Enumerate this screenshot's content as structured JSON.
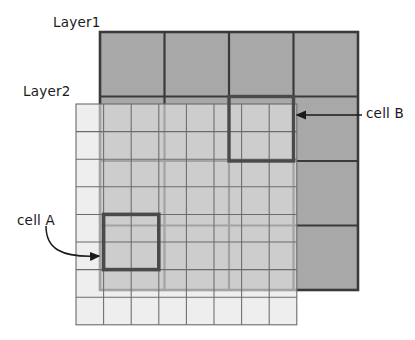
{
  "figure": {
    "title": "",
    "labels": {
      "layer1": "Layer1",
      "layer2": "Layer2",
      "cell_a": "cell A",
      "cell_b": "cell B"
    }
  },
  "colors": {
    "layer1_fill": "#a8a8a8",
    "layer1_stroke": "#3a3a3a",
    "layer2_fill": "#d9d9d9",
    "layer2_stroke": "#6b6b6b",
    "highlight_stroke": "#4a4a4a",
    "annotation": "#1a1a1a",
    "background": "#ffffff"
  },
  "chart_data": {
    "type": "diagram",
    "layers": [
      {
        "name": "Layer1",
        "rows": 4,
        "cols": 4,
        "cell_size": 64.5,
        "x": 100,
        "y": 32,
        "width": 258,
        "height": 258,
        "stroke_width": 2.6,
        "fill": "#a8a8a8",
        "stroke": "#3a3a3a"
      },
      {
        "name": "Layer2",
        "rows": 8,
        "cols": 8,
        "cell_size": 27.6,
        "x": 76,
        "y": 104,
        "width": 220.8,
        "height": 220.8,
        "stroke_width": 1.1,
        "fill": "#d9d9d9",
        "fill_opacity": 0.62,
        "stroke": "#6b6b6b"
      }
    ],
    "highlights": [
      {
        "name": "cell A",
        "layer": "Layer2",
        "col_start": 1,
        "row_start": 4,
        "cols": 2,
        "rows": 2,
        "x": 103.6,
        "y": 214.4,
        "width": 55.2,
        "height": 55.2
      },
      {
        "name": "cell B",
        "layer": "Layer1",
        "col": 2,
        "row": 1,
        "x": 229,
        "y": 96.5,
        "width": 64.5,
        "height": 64.5
      }
    ],
    "annotations": [
      {
        "label": "cell A",
        "arrow_type": "curved",
        "from": [
          46,
          228
        ],
        "to": [
          101,
          254
        ]
      },
      {
        "label": "cell B",
        "arrow_type": "straight",
        "from": [
          362,
          115
        ],
        "to": [
          297,
          115
        ]
      }
    ]
  }
}
